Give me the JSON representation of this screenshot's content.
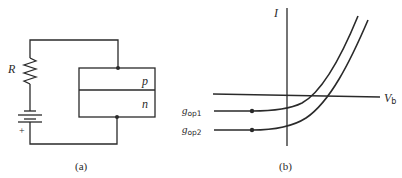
{
  "panel_a": {
    "caption": "(a)",
    "resistor_label": "R",
    "battery_polarity": "+",
    "junction": {
      "top_region": "p",
      "bottom_region": "n"
    }
  },
  "panel_b": {
    "caption": "(b)",
    "y_axis_label": "I",
    "x_axis_label_main": "V",
    "x_axis_label_sub": "b",
    "curves": [
      {
        "label_main": "g",
        "label_sub": "op1"
      },
      {
        "label_main": "g",
        "label_sub": "op2"
      }
    ]
  },
  "colors": {
    "ink": "#2a2a2a",
    "background": "#ffffff"
  }
}
